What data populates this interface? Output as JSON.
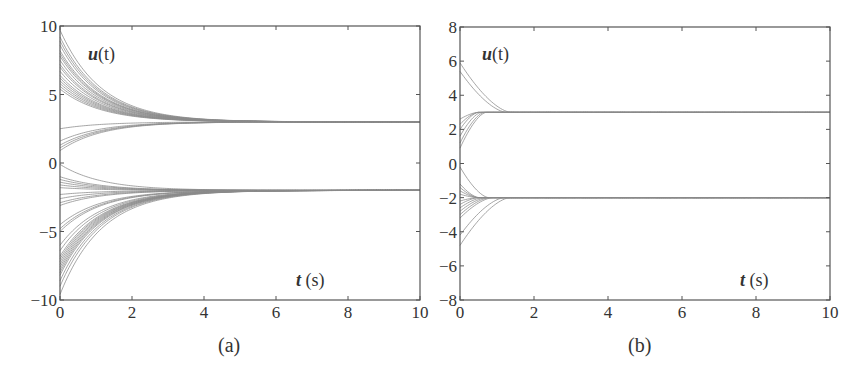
{
  "chart_data": [
    {
      "type": "line",
      "panel_caption": "(a)",
      "title": "",
      "ylabel": "u(t)",
      "xlabel": "t (s)",
      "xlim": [
        0,
        10
      ],
      "ylim": [
        -10,
        10
      ],
      "xticks": [
        0,
        2,
        4,
        6,
        8,
        10
      ],
      "yticks": [
        -10,
        -5,
        0,
        5,
        10
      ],
      "grid": false,
      "legend": null,
      "line_color": "#8a8a8a",
      "description": "Many trajectories u(t) converge exponentially to two equilibrium values: upper cluster to 3, lower cluster to -2, settling by about t = 5-6 s.",
      "equilibria": [
        3,
        -2
      ],
      "time_constant": 1.15,
      "series_groups": [
        {
          "name": "upper-from-above",
          "target": 3,
          "initial_values": [
            9.7,
            9.2,
            8.9,
            8.6,
            8.2,
            8.0,
            7.8,
            7.5,
            7.2,
            7.0,
            6.7,
            6.4,
            6.2,
            6.0,
            5.8,
            5.6,
            5.4
          ]
        },
        {
          "name": "upper-from-below",
          "target": 3,
          "initial_values": [
            2.5,
            1.6,
            1.3,
            1.1,
            0.9
          ]
        },
        {
          "name": "lower-from-above",
          "target": -2,
          "initial_values": [
            -0.1,
            -1.0,
            -1.2,
            -1.4,
            -1.6,
            -1.8
          ]
        },
        {
          "name": "lower-from-below",
          "target": -2,
          "initial_values": [
            -2.3,
            -2.6,
            -2.9,
            -3.1,
            -4.5,
            -4.8,
            -5.0,
            -6.0,
            -6.4,
            -6.8,
            -7.0,
            -7.2,
            -7.4,
            -7.6,
            -7.8,
            -8.0,
            -8.2,
            -8.6,
            -9.0,
            -9.6
          ]
        }
      ]
    },
    {
      "type": "line",
      "panel_caption": "(b)",
      "title": "",
      "ylabel": "u(t)",
      "xlabel": "t (s)",
      "xlim": [
        0,
        10
      ],
      "ylim": [
        -8,
        8
      ],
      "xticks": [
        0,
        2,
        4,
        6,
        8,
        10
      ],
      "yticks": [
        -8,
        -6,
        -4,
        -2,
        0,
        2,
        4,
        6,
        8
      ],
      "grid": false,
      "legend": null,
      "line_color": "#8a8a8a",
      "description": "Trajectories u(t) converge in finite time to 3 and -2; outermost trajectories start near 5.9 and -4.8 and settle by t ≈ 1.4 s, inner ones by t ≈ 0.8 s.",
      "equilibria": [
        3,
        -2
      ],
      "settling_time_max": 1.4,
      "series_groups": [
        {
          "name": "upper-from-above",
          "target": 3,
          "settle": 1.4,
          "initial_values": [
            5.9,
            5.4
          ]
        },
        {
          "name": "upper-from-below",
          "target": 3,
          "settle": 0.85,
          "initial_values": [
            2.6,
            2.3,
            2.0,
            1.6,
            1.2,
            0.9
          ]
        },
        {
          "name": "lower-from-above",
          "target": -2,
          "settle": 1.0,
          "initial_values": [
            -0.2,
            -1.2,
            -1.4,
            -1.6,
            -1.8
          ]
        },
        {
          "name": "lower-from-below",
          "target": -2,
          "settle": 1.4,
          "initial_values": [
            -2.2,
            -2.4,
            -2.6,
            -2.8,
            -3.0,
            -3.2,
            -4.2,
            -4.8
          ]
        }
      ]
    }
  ],
  "panels": [
    {
      "caption": "(a)",
      "ylabel_var": "u",
      "ylabel_arg": "(t)",
      "xlabel_var": "t",
      "xlabel_unit": " (s)"
    },
    {
      "caption": "(b)",
      "ylabel_var": "u",
      "ylabel_arg": "(t)",
      "xlabel_var": "t",
      "xlabel_unit": " (s)"
    }
  ]
}
